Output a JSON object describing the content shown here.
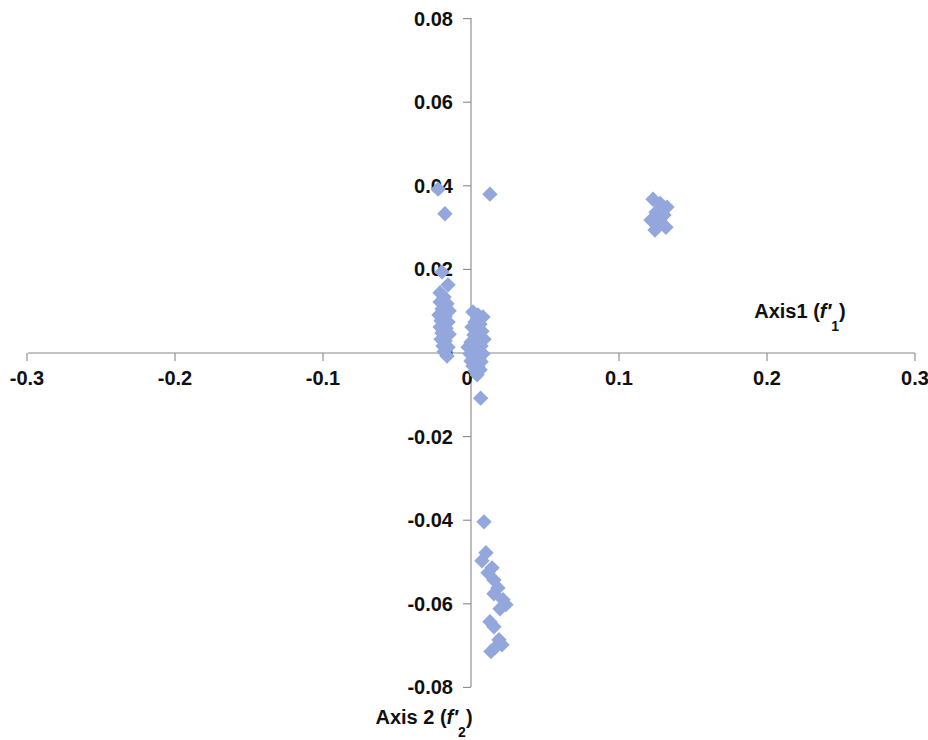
{
  "chart_data": {
    "type": "scatter",
    "title": "",
    "xlabel": "Axis1 (f'1)",
    "ylabel": "Axis 2 (f'2)",
    "xlabel_parts": {
      "name": "Axis1",
      "open": " (",
      "var": "f",
      "prime": "′",
      "sub": "1",
      "close": ")"
    },
    "ylabel_parts": {
      "name": "Axis 2",
      "open": " (",
      "var": "f",
      "prime": "′",
      "sub": "2",
      "close": ")"
    },
    "xlim": [
      -0.3,
      0.3
    ],
    "ylim": [
      -0.08,
      0.08
    ],
    "xticks": [
      -0.3,
      -0.2,
      -0.1,
      0,
      0.1,
      0.2,
      0.3
    ],
    "xtick_labels": [
      "-0.3",
      "-0.2",
      "-0.1",
      "0",
      "0.1",
      "0.2",
      "0.3"
    ],
    "yticks": [
      -0.08,
      -0.06,
      -0.04,
      -0.02,
      0,
      0.02,
      0.04,
      0.06,
      0.08
    ],
    "ytick_labels": [
      "-0.08",
      "-0.06",
      "-0.04",
      "-0.02",
      "0",
      "0.02",
      "0.04",
      "0.06",
      "0.08"
    ],
    "grid": false,
    "legend": false,
    "marker": {
      "shape": "diamond",
      "color": "#93A7DD",
      "size": 11
    },
    "axis_color": "#888888",
    "series": [
      {
        "name": "samples",
        "color": "#93A7DD",
        "points": [
          [
            -0.0222,
            0.0392
          ],
          [
            -0.0176,
            0.0333
          ],
          [
            -0.0196,
            0.0194
          ],
          [
            -0.0155,
            0.0163
          ],
          [
            -0.0209,
            0.0144
          ],
          [
            -0.0182,
            0.0134
          ],
          [
            -0.0209,
            0.0122
          ],
          [
            -0.0162,
            0.0118
          ],
          [
            -0.0196,
            0.0105
          ],
          [
            -0.0148,
            0.0101
          ],
          [
            -0.0216,
            0.0091
          ],
          [
            -0.0175,
            0.0088
          ],
          [
            -0.0202,
            0.0077
          ],
          [
            -0.0155,
            0.0074
          ],
          [
            -0.0209,
            0.0062
          ],
          [
            -0.0168,
            0.0059
          ],
          [
            -0.0196,
            0.0048
          ],
          [
            -0.0148,
            0.0045
          ],
          [
            -0.0202,
            0.0033
          ],
          [
            -0.0175,
            0.0029
          ],
          [
            -0.0189,
            0.0017
          ],
          [
            -0.0155,
            0.0014
          ],
          [
            -0.0182,
            0.0003
          ],
          [
            -0.0162,
            -0.0007
          ],
          [
            0.0013,
            0.0098
          ],
          [
            0.0047,
            0.0091
          ],
          [
            0.0081,
            0.0086
          ],
          [
            0.0027,
            0.0074
          ],
          [
            0.0061,
            0.0069
          ],
          [
            0.0007,
            0.0062
          ],
          [
            0.0041,
            0.0057
          ],
          [
            0.0074,
            0.0052
          ],
          [
            0.002,
            0.0043
          ],
          [
            0.0054,
            0.0038
          ],
          [
            0.0088,
            0.0033
          ],
          [
            0.0,
            0.0026
          ],
          [
            0.0034,
            0.0021
          ],
          [
            0.0068,
            0.0017
          ],
          [
            0.0013,
            0.0007
          ],
          [
            0.0047,
            0.0002
          ],
          [
            0.0081,
            -0.0002
          ],
          [
            -0.002,
            0.0014
          ],
          [
            -0.0007,
            -0.0002
          ],
          [
            0.002,
            -0.0012
          ],
          [
            0.0054,
            -0.0014
          ],
          [
            0.0,
            -0.0019
          ],
          [
            0.0034,
            -0.0024
          ],
          [
            0.0068,
            -0.0021
          ],
          [
            0.0013,
            -0.0031
          ],
          [
            0.0047,
            -0.0033
          ],
          [
            0.0027,
            -0.0043
          ],
          [
            0.0061,
            -0.004
          ],
          [
            0.0041,
            -0.0052
          ],
          [
            0.0065,
            -0.0108
          ],
          [
            0.0128,
            0.038
          ],
          [
            0.123,
            0.0368
          ],
          [
            0.1277,
            0.0358
          ],
          [
            0.1324,
            0.0349
          ],
          [
            0.125,
            0.0337
          ],
          [
            0.1304,
            0.033
          ],
          [
            0.1216,
            0.0318
          ],
          [
            0.127,
            0.0311
          ],
          [
            0.1317,
            0.0301
          ],
          [
            0.1243,
            0.0294
          ],
          [
            0.0088,
            -0.0404
          ],
          [
            0.0101,
            -0.0478
          ],
          [
            0.0074,
            -0.0497
          ],
          [
            0.0142,
            -0.0514
          ],
          [
            0.0115,
            -0.0526
          ],
          [
            0.0155,
            -0.0543
          ],
          [
            0.0182,
            -0.0562
          ],
          [
            0.0155,
            -0.0576
          ],
          [
            0.0216,
            -0.059
          ],
          [
            0.0236,
            -0.0602
          ],
          [
            0.0196,
            -0.0612
          ],
          [
            0.0128,
            -0.0643
          ],
          [
            0.0155,
            -0.0655
          ],
          [
            0.0189,
            -0.0686
          ],
          [
            0.0209,
            -0.0698
          ],
          [
            0.0162,
            -0.0705
          ],
          [
            0.0135,
            -0.0714
          ]
        ]
      }
    ]
  },
  "geometry": {
    "origin_x": 471,
    "origin_y": 353,
    "px_per_x_unit": 1480,
    "px_per_y_unit": 4180,
    "x_axis_left": 28,
    "x_axis_right": 915,
    "y_axis_top": 18,
    "y_axis_bottom": 687,
    "tick_len": 8,
    "xlabel_pos": {
      "x": 800,
      "y": 318
    },
    "ylabel_pos": {
      "x": 424,
      "y": 724
    }
  }
}
